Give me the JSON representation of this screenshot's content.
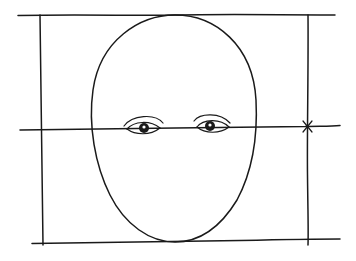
{
  "diagram": {
    "title": "",
    "colors": {
      "ink": "#1a1a1a",
      "background": "#ffffff"
    },
    "elements": [
      {
        "type": "frame-line",
        "name": "top-guide"
      },
      {
        "type": "frame-line",
        "name": "bottom-guide"
      },
      {
        "type": "frame-line",
        "name": "left-guide"
      },
      {
        "type": "frame-line",
        "name": "right-guide"
      },
      {
        "type": "guide-line",
        "name": "eye-line"
      },
      {
        "type": "shape",
        "name": "head-oval"
      },
      {
        "type": "feature",
        "name": "left-eye"
      },
      {
        "type": "feature",
        "name": "right-eye"
      },
      {
        "type": "mark",
        "name": "midpoint-tick"
      }
    ]
  }
}
